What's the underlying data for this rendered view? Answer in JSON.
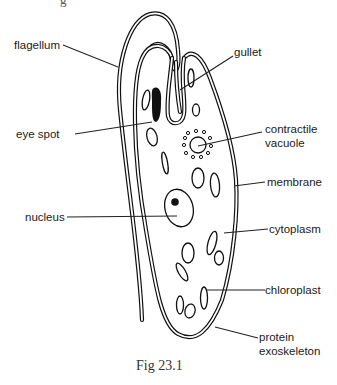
{
  "figure": {
    "caption": "Fig 23.1",
    "top_text_fragment": "g",
    "labels": {
      "flagellum": "flagellum",
      "gullet": "gullet",
      "eye_spot": "eye spot",
      "contractile_vacuole_line1": "contractile",
      "contractile_vacuole_line2": "vacuole",
      "membrane": "membrane",
      "nucleus": "nucleus",
      "cytoplasm": "cytoplasm",
      "chloroplast": "chloroplast",
      "protein_exoskeleton_line1": "protein",
      "protein_exoskeleton_line2": "exoskeleton"
    }
  }
}
